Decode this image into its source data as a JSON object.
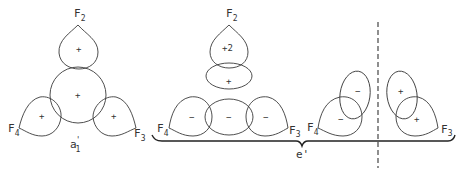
{
  "diagram": {
    "atoms": {
      "F2": "F",
      "F3": "F",
      "F4": "F",
      "sub2": "2",
      "sub3": "3",
      "sub4": "4"
    },
    "panels": [
      {
        "id": "a1",
        "label": "a",
        "label_sub": "1",
        "label_prime": "'",
        "signs": {
          "top": "+",
          "center": "+",
          "left": "+",
          "right": "+"
        }
      },
      {
        "id": "e-prime-1",
        "signs": {
          "top": "+2",
          "middle": "+",
          "bottom_left": "−",
          "bottom_center": "−",
          "bottom_right": "−"
        }
      },
      {
        "id": "e-prime-2",
        "signs": {
          "left_ellipse": "−",
          "left_lobe": "−",
          "right_ellipse": "+",
          "right_lobe": "+"
        }
      }
    ],
    "group_label": "e'",
    "colors": {
      "line": "#3a3a3a",
      "text": "#333333",
      "background": "#ffffff"
    }
  }
}
